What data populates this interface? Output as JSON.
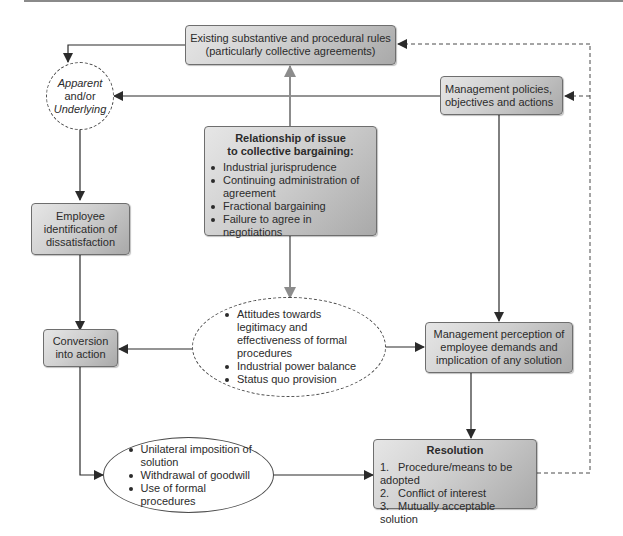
{
  "diagram": {
    "nodes": {
      "existing_rules": {
        "line1": "Existing substantive and procedural rules",
        "line2": "(particularly collective agreements)"
      },
      "apparent_underlying": {
        "line1": "Apparent",
        "line2": "and/or",
        "line3": "Underlying"
      },
      "management_policies": {
        "line1": "Management policies,",
        "line2": "objectives and actions"
      },
      "relationship": {
        "title_line1": "Relationship of issue",
        "title_line2": "to collective bargaining:",
        "items": [
          "Industrial jurisprudence",
          "Continuing administration of agreement",
          "Fractional bargaining",
          "Failure to agree in negotiations"
        ]
      },
      "employee_identification": {
        "line1": "Employee",
        "line2": "identification of",
        "line3": "dissatisfaction"
      },
      "conversion": {
        "line1": "Conversion",
        "line2": "into action"
      },
      "attitudes": {
        "items": [
          "Attitudes towards legitimacy and effectiveness of formal procedures",
          "Industrial power balance",
          "Status quo provision"
        ]
      },
      "management_perception": {
        "line1": "Management perception of",
        "line2": "employee demands and",
        "line3": "implication of any solution"
      },
      "actions": {
        "items": [
          "Unilateral imposition of solution",
          "Withdrawal of goodwill",
          "Use of formal procedures"
        ]
      },
      "resolution": {
        "title": "Resolution",
        "items": [
          {
            "num": "1.",
            "text": "Procedure/means to be adopted"
          },
          {
            "num": "2.",
            "text": "Conflict of interest"
          },
          {
            "num": "3.",
            "text": "Mutually acceptable solution"
          }
        ]
      }
    },
    "colors": {
      "box_fill_light": "#e6e6e6",
      "box_fill_dark": "#a9a9a9",
      "arrow_dark": "#2b2b2b",
      "arrow_gray": "#8c8c8c"
    }
  }
}
